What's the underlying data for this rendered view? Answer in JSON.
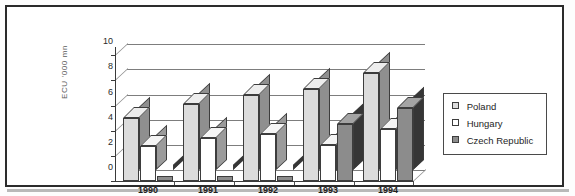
{
  "chart_data": {
    "type": "bar",
    "title": "",
    "subtitle": "",
    "xlabel": "",
    "ylabel": "ECU '000 mn",
    "categories": [
      "1990",
      "1991",
      "1992",
      "1993",
      "1994"
    ],
    "series": [
      {
        "name": "Poland",
        "color": "#dcdcdc",
        "values": [
          5.0,
          6.1,
          6.8,
          7.3,
          8.6
        ]
      },
      {
        "name": "Hungary",
        "color": "#ffffff",
        "values": [
          2.8,
          3.4,
          3.7,
          2.9,
          4.1
        ]
      },
      {
        "name": "Czech Republic",
        "color": "#8c8c8c",
        "values": [
          0,
          0,
          0,
          4.5,
          5.8
        ]
      }
    ],
    "ylim": [
      0,
      10
    ],
    "yticks": [
      "0",
      "2",
      "4",
      "6",
      "8",
      "10"
    ],
    "grid": true,
    "legend_position": "right",
    "style_3d": true,
    "annotations": []
  },
  "legend": {
    "items": [
      {
        "label": "Poland",
        "swatch": "legend-swatch-poland"
      },
      {
        "label": "Hungary",
        "swatch": "legend-swatch-hungary"
      },
      {
        "label": "Czech Republic",
        "swatch": "legend-swatch-czech"
      }
    ]
  }
}
